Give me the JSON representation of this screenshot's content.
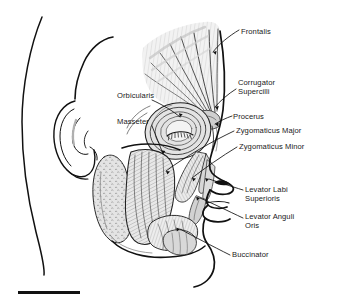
{
  "figure": {
    "background_color": "#ffffff",
    "ink_color": "#1a1a1a",
    "muscle_fill": "#d9d9d9",
    "shadow_fill": "#b3b3b3"
  },
  "labels": [
    {
      "id": "frontalis",
      "text": "Frontalis",
      "x": 241,
      "y": 27,
      "lines": [
        "Frontalis"
      ]
    },
    {
      "id": "corrugator-supercilli",
      "text": "Corrugator Supercilli",
      "x": 238,
      "y": 83,
      "lines": [
        "Corrugator",
        "Supercilli"
      ]
    },
    {
      "id": "procerus",
      "text": "Procerus",
      "x": 233,
      "y": 113,
      "lines": [
        "Procerus"
      ]
    },
    {
      "id": "zygomaticus-major",
      "text": "Zygomaticus Major",
      "x": 236,
      "y": 129,
      "lines": [
        "Zygomaticus Major"
      ]
    },
    {
      "id": "zygomaticus-minor",
      "text": "Zygomaticus Minor",
      "x": 239,
      "y": 145,
      "lines": [
        "Zygomaticus Minor"
      ]
    },
    {
      "id": "levator-labi-superioris",
      "text": "Levator Labi Superioris",
      "x": 245,
      "y": 190,
      "lines": [
        "Levator Labi",
        "Superioris"
      ]
    },
    {
      "id": "levator-anguli-oris",
      "text": "Levator Anguli Oris",
      "x": 245,
      "y": 217,
      "lines": [
        "Levator Anguli",
        "Oris"
      ]
    },
    {
      "id": "buccinator",
      "text": "Buccinator",
      "x": 232,
      "y": 253,
      "lines": [
        "Buccinator"
      ]
    },
    {
      "id": "orbicularis",
      "text": "Orbicularis",
      "x": 117,
      "y": 95,
      "lines": [
        "Orbicularis"
      ]
    },
    {
      "id": "masseter",
      "text": "Masseter",
      "x": 117,
      "y": 121,
      "lines": [
        "Masseter"
      ]
    }
  ],
  "scale_bar": {
    "x": 18,
    "y": 291,
    "width": 62,
    "height": 3,
    "color": "#111111",
    "caption": ""
  }
}
